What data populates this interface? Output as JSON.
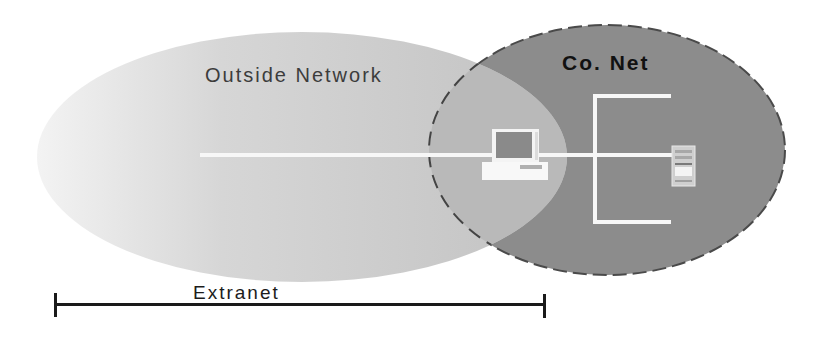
{
  "diagram": {
    "type": "network-zones-overlap",
    "outside_network": {
      "label": "Outside Network",
      "fill_light": "#f2f2f2",
      "fill_dark": "#c4c4c4"
    },
    "company_network": {
      "label": "Co. Net",
      "fill": "#8c8c8c",
      "border": "#444444",
      "border_style": "dashed"
    },
    "overlap_fill": "#b9b9b9",
    "nodes": [
      {
        "id": "workstation",
        "icon": "desktop-computer-icon",
        "zone": "overlap"
      },
      {
        "id": "server",
        "icon": "server-tower-icon",
        "zone": "company_network"
      }
    ],
    "links_color": "#f7f7f7",
    "span": {
      "label": "Extranet",
      "color": "#1a1a1a"
    }
  }
}
